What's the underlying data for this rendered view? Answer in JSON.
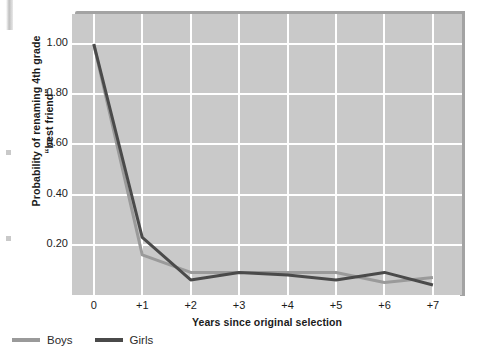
{
  "figure": {
    "y_axis_title": "Probability of renaming 4th grade “best friend”",
    "x_axis_title": "Years since original selection"
  },
  "legend": {
    "position": "below-plot-left",
    "items": [
      {
        "label": "Boys",
        "color": "#9a9a9a",
        "swatch_name": "boys-line-swatch"
      },
      {
        "label": "Girls",
        "color": "#4a4a4a",
        "swatch_name": "girls-line-swatch"
      }
    ]
  },
  "colors": {
    "plot_background": "#c9c9c9",
    "gridline": "#ffffff",
    "boys": "#9a9a9a",
    "girls": "#4a4a4a",
    "text": "#1b1b1b",
    "shadow": "#a3a3a3"
  },
  "chart_data": {
    "type": "line",
    "title": "",
    "xlabel": "Years since original selection",
    "ylabel": "Probability of renaming 4th grade “best friend”",
    "categories": [
      "0",
      "+1",
      "+2",
      "+3",
      "+4",
      "+5",
      "+6",
      "+7"
    ],
    "x": [
      0,
      1,
      2,
      3,
      4,
      5,
      6,
      7
    ],
    "xlim": [
      -0.45,
      7.6
    ],
    "ylim": [
      0.0,
      1.12
    ],
    "yticks": [
      0.2,
      0.4,
      0.6,
      0.8,
      1.0
    ],
    "ytick_labels": [
      "0.20",
      "0.40",
      "0.60",
      "0.80",
      "1.00"
    ],
    "grid": true,
    "grid_axes": "both",
    "legend_position": "below",
    "series": [
      {
        "name": "Boys",
        "color": "#9a9a9a",
        "values": [
          1.0,
          0.16,
          0.09,
          0.09,
          0.09,
          0.09,
          0.05,
          0.07
        ]
      },
      {
        "name": "Girls",
        "color": "#4a4a4a",
        "values": [
          1.0,
          0.23,
          0.06,
          0.09,
          0.08,
          0.06,
          0.09,
          0.04
        ]
      }
    ]
  }
}
